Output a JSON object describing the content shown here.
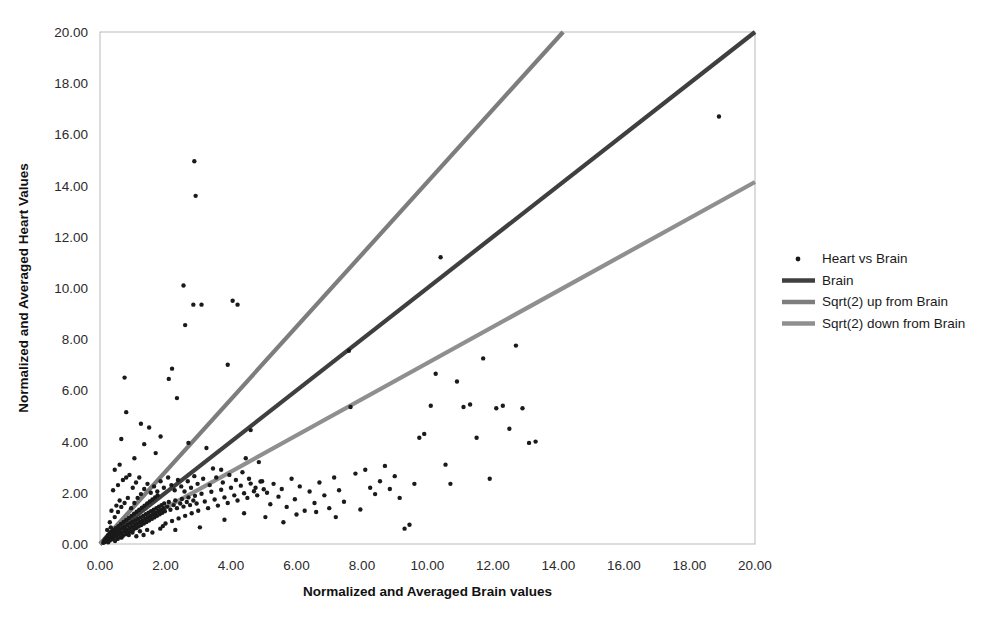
{
  "chart_data": {
    "type": "scatter",
    "title": "",
    "xlabel": "Normalized and Averaged Brain values",
    "ylabel": "Normalized and Averaged Heart Values",
    "xlim": [
      0,
      20
    ],
    "ylim": [
      0,
      20
    ],
    "xticks": [
      "0.00",
      "2.00",
      "4.00",
      "6.00",
      "8.00",
      "10.00",
      "12.00",
      "14.00",
      "16.00",
      "18.00",
      "20.00"
    ],
    "yticks": [
      "0.00",
      "2.00",
      "4.00",
      "6.00",
      "8.00",
      "10.00",
      "12.00",
      "14.00",
      "16.00",
      "18.00",
      "20.00"
    ],
    "xtick_values": [
      0,
      2,
      4,
      6,
      8,
      10,
      12,
      14,
      16,
      18,
      20
    ],
    "ytick_values": [
      0,
      2,
      4,
      6,
      8,
      10,
      12,
      14,
      16,
      18,
      20
    ],
    "grid": false,
    "legend_position": "right",
    "series": [
      {
        "name": "Heart vs Brain",
        "type": "scatter",
        "marker": "dot",
        "color": "#1a1a1a",
        "points": [
          [
            0.1,
            0.05
          ],
          [
            0.12,
            0.12
          ],
          [
            0.14,
            0.08
          ],
          [
            0.16,
            0.2
          ],
          [
            0.18,
            0.1
          ],
          [
            0.2,
            0.26
          ],
          [
            0.22,
            0.15
          ],
          [
            0.24,
            0.33
          ],
          [
            0.25,
            0.07
          ],
          [
            0.27,
            0.22
          ],
          [
            0.29,
            0.4
          ],
          [
            0.3,
            0.14
          ],
          [
            0.32,
            0.28
          ],
          [
            0.34,
            0.48
          ],
          [
            0.36,
            0.18
          ],
          [
            0.38,
            0.36
          ],
          [
            0.4,
            0.55
          ],
          [
            0.42,
            0.24
          ],
          [
            0.44,
            0.42
          ],
          [
            0.46,
            0.12
          ],
          [
            0.48,
            0.62
          ],
          [
            0.5,
            0.3
          ],
          [
            0.52,
            0.5
          ],
          [
            0.54,
            0.2
          ],
          [
            0.56,
            0.7
          ],
          [
            0.58,
            0.38
          ],
          [
            0.6,
            0.56
          ],
          [
            0.62,
            0.26
          ],
          [
            0.64,
            0.78
          ],
          [
            0.66,
            0.44
          ],
          [
            0.68,
            0.62
          ],
          [
            0.7,
            0.32
          ],
          [
            0.72,
            0.86
          ],
          [
            0.74,
            0.5
          ],
          [
            0.76,
            0.68
          ],
          [
            0.78,
            0.38
          ],
          [
            0.8,
            0.94
          ],
          [
            0.82,
            0.56
          ],
          [
            0.84,
            0.74
          ],
          [
            0.86,
            0.44
          ],
          [
            0.88,
            1.02
          ],
          [
            0.9,
            0.62
          ],
          [
            0.92,
            0.8
          ],
          [
            0.94,
            0.5
          ],
          [
            0.96,
            1.1
          ],
          [
            0.98,
            0.68
          ],
          [
            1.0,
            0.86
          ],
          [
            1.02,
            0.56
          ],
          [
            1.04,
            1.18
          ],
          [
            1.06,
            0.74
          ],
          [
            1.08,
            0.92
          ],
          [
            1.1,
            0.62
          ],
          [
            1.12,
            1.26
          ],
          [
            1.14,
            0.8
          ],
          [
            1.16,
            0.98
          ],
          [
            1.18,
            0.68
          ],
          [
            1.2,
            1.34
          ],
          [
            1.22,
            0.86
          ],
          [
            1.24,
            1.04
          ],
          [
            1.26,
            0.74
          ],
          [
            1.28,
            1.42
          ],
          [
            1.3,
            0.92
          ],
          [
            1.32,
            1.1
          ],
          [
            1.34,
            0.8
          ],
          [
            1.36,
            1.5
          ],
          [
            1.38,
            0.98
          ],
          [
            1.4,
            1.16
          ],
          [
            1.42,
            0.86
          ],
          [
            1.44,
            1.58
          ],
          [
            1.46,
            1.04
          ],
          [
            1.48,
            1.22
          ],
          [
            1.5,
            0.92
          ],
          [
            1.52,
            1.66
          ],
          [
            1.54,
            1.1
          ],
          [
            1.56,
            1.28
          ],
          [
            1.58,
            0.98
          ],
          [
            1.6,
            1.74
          ],
          [
            1.62,
            1.16
          ],
          [
            1.64,
            1.34
          ],
          [
            1.66,
            1.04
          ],
          [
            1.68,
            1.82
          ],
          [
            1.7,
            1.22
          ],
          [
            1.72,
            1.4
          ],
          [
            1.74,
            1.1
          ],
          [
            1.76,
            1.9
          ],
          [
            1.78,
            1.28
          ],
          [
            1.8,
            1.46
          ],
          [
            1.82,
            1.16
          ],
          [
            1.84,
            0.6
          ],
          [
            1.86,
            1.34
          ],
          [
            1.88,
            1.52
          ],
          [
            1.9,
            1.22
          ],
          [
            1.92,
            0.7
          ],
          [
            1.94,
            1.4
          ],
          [
            1.96,
            1.58
          ],
          [
            1.98,
            1.28
          ],
          [
            2.0,
            0.8
          ],
          [
            2.05,
            1.46
          ],
          [
            2.1,
            1.64
          ],
          [
            2.15,
            1.34
          ],
          [
            2.2,
            0.9
          ],
          [
            2.25,
            1.52
          ],
          [
            2.3,
            1.7
          ],
          [
            2.35,
            1.4
          ],
          [
            2.4,
            1.0
          ],
          [
            2.45,
            1.58
          ],
          [
            2.5,
            1.76
          ],
          [
            2.55,
            1.46
          ],
          [
            2.6,
            1.1
          ],
          [
            2.65,
            1.64
          ],
          [
            2.7,
            1.82
          ],
          [
            2.75,
            1.52
          ],
          [
            2.8,
            1.2
          ],
          [
            2.85,
            1.7
          ],
          [
            2.9,
            1.88
          ],
          [
            2.95,
            1.58
          ],
          [
            3.0,
            1.3
          ],
          [
            3.1,
            1.96
          ],
          [
            3.2,
            1.66
          ],
          [
            3.3,
            1.4
          ],
          [
            3.4,
            2.04
          ],
          [
            3.5,
            1.74
          ],
          [
            3.6,
            1.5
          ],
          [
            3.7,
            2.12
          ],
          [
            3.8,
            1.82
          ],
          [
            3.9,
            1.6
          ],
          [
            4.0,
            2.2
          ],
          [
            4.1,
            1.9
          ],
          [
            4.2,
            1.7
          ],
          [
            4.3,
            2.28
          ],
          [
            4.4,
            1.98
          ],
          [
            4.5,
            1.8
          ],
          [
            4.6,
            2.36
          ],
          [
            4.7,
            2.06
          ],
          [
            4.8,
            1.9
          ],
          [
            4.9,
            2.44
          ],
          [
            5.0,
            2.14
          ],
          [
            0.3,
            0.85
          ],
          [
            0.45,
            1.05
          ],
          [
            0.55,
            1.25
          ],
          [
            0.65,
            1.45
          ],
          [
            0.35,
            1.3
          ],
          [
            0.5,
            1.5
          ],
          [
            0.6,
            1.7
          ],
          [
            0.75,
            1.6
          ],
          [
            0.85,
            1.8
          ],
          [
            0.95,
            1.4
          ],
          [
            1.05,
            1.6
          ],
          [
            1.15,
            1.8
          ],
          [
            1.25,
            1.95
          ],
          [
            0.4,
            2.1
          ],
          [
            0.55,
            2.3
          ],
          [
            0.7,
            2.5
          ],
          [
            0.9,
            2.7
          ],
          [
            1.1,
            2.4
          ],
          [
            0.45,
            2.9
          ],
          [
            0.6,
            3.1
          ],
          [
            0.8,
            2.6
          ],
          [
            1.0,
            2.2
          ],
          [
            1.2,
            2.6
          ],
          [
            1.35,
            2.15
          ],
          [
            1.45,
            2.35
          ],
          [
            1.55,
            2.0
          ],
          [
            1.65,
            2.25
          ],
          [
            1.75,
            2.05
          ],
          [
            1.85,
            2.45
          ],
          [
            1.95,
            2.2
          ],
          [
            2.08,
            2.6
          ],
          [
            2.18,
            2.3
          ],
          [
            2.28,
            2.1
          ],
          [
            2.38,
            2.5
          ],
          [
            2.48,
            2.25
          ],
          [
            2.58,
            2.05
          ],
          [
            2.68,
            2.45
          ],
          [
            2.78,
            2.2
          ],
          [
            2.88,
            2.65
          ],
          [
            2.98,
            2.35
          ],
          [
            3.15,
            2.55
          ],
          [
            3.35,
            2.3
          ],
          [
            3.55,
            2.6
          ],
          [
            3.75,
            2.4
          ],
          [
            3.95,
            2.7
          ],
          [
            4.15,
            2.5
          ],
          [
            4.35,
            2.8
          ],
          [
            4.55,
            2.55
          ],
          [
            4.75,
            2.2
          ],
          [
            4.95,
            2.45
          ],
          [
            0.65,
            4.1
          ],
          [
            0.75,
            6.5
          ],
          [
            0.8,
            5.15
          ],
          [
            1.05,
            3.35
          ],
          [
            1.25,
            4.7
          ],
          [
            1.35,
            3.9
          ],
          [
            1.5,
            4.55
          ],
          [
            1.7,
            3.55
          ],
          [
            1.85,
            4.2
          ],
          [
            2.1,
            6.45
          ],
          [
            2.2,
            6.85
          ],
          [
            2.35,
            5.7
          ],
          [
            2.55,
            10.1
          ],
          [
            2.6,
            8.55
          ],
          [
            2.7,
            3.95
          ],
          [
            2.85,
            9.35
          ],
          [
            2.88,
            14.95
          ],
          [
            2.92,
            13.6
          ],
          [
            3.1,
            9.35
          ],
          [
            3.25,
            3.75
          ],
          [
            3.45,
            2.95
          ],
          [
            3.7,
            2.9
          ],
          [
            3.9,
            7.0
          ],
          [
            4.05,
            9.5
          ],
          [
            4.2,
            9.35
          ],
          [
            4.45,
            3.35
          ],
          [
            4.6,
            4.45
          ],
          [
            4.85,
            3.2
          ],
          [
            5.1,
            2.0
          ],
          [
            5.2,
            1.55
          ],
          [
            5.3,
            2.35
          ],
          [
            5.45,
            1.85
          ],
          [
            5.55,
            2.15
          ],
          [
            5.7,
            1.45
          ],
          [
            5.85,
            2.55
          ],
          [
            5.95,
            1.75
          ],
          [
            6.1,
            2.25
          ],
          [
            6.25,
            1.3
          ],
          [
            6.4,
            2.05
          ],
          [
            6.55,
            1.6
          ],
          [
            6.7,
            2.4
          ],
          [
            6.85,
            1.9
          ],
          [
            7.0,
            1.4
          ],
          [
            7.15,
            2.6
          ],
          [
            7.3,
            2.1
          ],
          [
            7.45,
            1.65
          ],
          [
            7.6,
            7.55
          ],
          [
            7.65,
            5.35
          ],
          [
            7.8,
            2.75
          ],
          [
            7.95,
            1.35
          ],
          [
            8.1,
            2.9
          ],
          [
            8.25,
            2.2
          ],
          [
            8.4,
            1.95
          ],
          [
            8.55,
            2.45
          ],
          [
            8.7,
            3.05
          ],
          [
            8.85,
            2.15
          ],
          [
            9.0,
            2.65
          ],
          [
            9.15,
            1.8
          ],
          [
            9.3,
            0.6
          ],
          [
            9.45,
            0.75
          ],
          [
            9.6,
            2.35
          ],
          [
            9.75,
            4.15
          ],
          [
            9.9,
            4.3
          ],
          [
            10.1,
            5.4
          ],
          [
            10.25,
            6.65
          ],
          [
            10.4,
            11.2
          ],
          [
            10.55,
            3.1
          ],
          [
            10.7,
            2.35
          ],
          [
            10.9,
            6.35
          ],
          [
            11.1,
            5.35
          ],
          [
            11.3,
            5.45
          ],
          [
            11.5,
            4.15
          ],
          [
            11.7,
            7.25
          ],
          [
            11.9,
            2.55
          ],
          [
            12.1,
            5.3
          ],
          [
            12.3,
            5.4
          ],
          [
            12.5,
            4.5
          ],
          [
            12.7,
            7.75
          ],
          [
            12.9,
            5.3
          ],
          [
            13.1,
            3.95
          ],
          [
            13.3,
            4.0
          ],
          [
            1.6,
            0.45
          ],
          [
            2.3,
            0.55
          ],
          [
            3.05,
            0.65
          ],
          [
            3.8,
            0.95
          ],
          [
            4.4,
            1.2
          ],
          [
            5.05,
            1.05
          ],
          [
            5.6,
            0.85
          ],
          [
            6.0,
            1.15
          ],
          [
            6.6,
            1.25
          ],
          [
            7.2,
            1.05
          ],
          [
            0.22,
            0.55
          ],
          [
            0.33,
            0.65
          ],
          [
            0.44,
            0.35
          ],
          [
            0.55,
            0.45
          ],
          [
            0.66,
            0.25
          ],
          [
            0.77,
            0.55
          ],
          [
            0.88,
            0.35
          ],
          [
            0.99,
            0.45
          ],
          [
            1.11,
            0.3
          ],
          [
            1.22,
            0.5
          ],
          [
            1.33,
            0.35
          ],
          [
            1.44,
            0.55
          ],
          [
            18.9,
            16.7
          ]
        ]
      },
      {
        "name": "Brain",
        "type": "line",
        "color": "#3f3f3f",
        "slope": 1.0,
        "line_points": [
          [
            0,
            0
          ],
          [
            20,
            20
          ]
        ]
      },
      {
        "name": "Sqrt(2) up from Brain",
        "type": "line",
        "color": "#7d7d7d",
        "slope": 1.41421,
        "line_points": [
          [
            0,
            0
          ],
          [
            14.14,
            20
          ]
        ]
      },
      {
        "name": "Sqrt(2) down from Brain",
        "type": "line",
        "color": "#8f8f8f",
        "slope": 0.70711,
        "line_points": [
          [
            0,
            0
          ],
          [
            20,
            14.14
          ]
        ]
      }
    ],
    "legend": [
      {
        "label": "Heart vs Brain",
        "marker": "dot",
        "color": "#1a1a1a"
      },
      {
        "label": "Brain",
        "marker": "line",
        "color": "#3f3f3f"
      },
      {
        "label": "Sqrt(2) up from Brain",
        "marker": "line",
        "color": "#7d7d7d"
      },
      {
        "label": "Sqrt(2) down from Brain",
        "marker": "line",
        "color": "#8f8f8f"
      }
    ],
    "colors": {
      "background": "#ffffff",
      "plot_border": "#b9b9b9",
      "text": "#1a1a1a"
    }
  }
}
